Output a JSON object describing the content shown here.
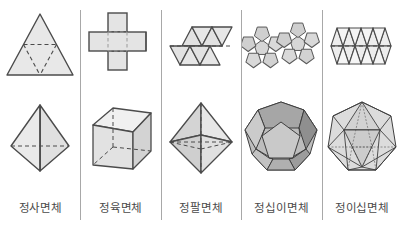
{
  "figure": {
    "columns": [
      {
        "label": "정사면체",
        "net_name": "tetrahedron-net",
        "solid_name": "tetrahedron-solid",
        "faces": 4,
        "face_shape": "triangle"
      },
      {
        "label": "정육면체",
        "net_name": "cube-net",
        "solid_name": "cube-solid",
        "faces": 6,
        "face_shape": "square"
      },
      {
        "label": "정팔면체",
        "net_name": "octahedron-net",
        "solid_name": "octahedron-solid",
        "faces": 8,
        "face_shape": "triangle"
      },
      {
        "label": "정십이면체",
        "net_name": "dodecahedron-net",
        "solid_name": "dodecahedron-solid",
        "faces": 12,
        "face_shape": "pentagon"
      },
      {
        "label": "정이십면체",
        "net_name": "icosahedron-net",
        "solid_name": "icosahedron-solid",
        "faces": 20,
        "face_shape": "triangle"
      }
    ]
  },
  "colors": {
    "background": "#ffffff",
    "face_fill": "#e2e2e2",
    "face_fill_light": "#efefef",
    "face_fill_mid": "#cfcfcf",
    "face_fill_dark": "#a9a9a9",
    "face_fill_darker": "#8f8f8f",
    "stroke": "#4b4b4b",
    "stroke_light": "#8a8a8a",
    "divider": "#a8a8a8",
    "label_text": "#4a4a4a"
  }
}
